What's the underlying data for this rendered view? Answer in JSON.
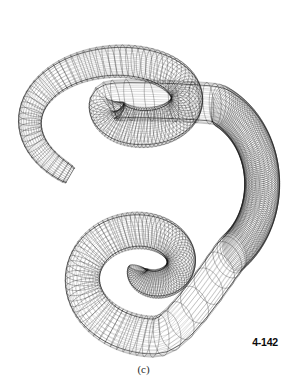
{
  "figure": {
    "number_label": "4-142",
    "caption": "(c)",
    "background_color": "#ffffff",
    "line_color": "#141414"
  },
  "chart_data": {
    "type": "line",
    "xlabel": "",
    "ylabel": "",
    "grid": false,
    "legend_position": "none",
    "xlim": [
      0,
      287
    ],
    "ylim": [
      0,
      386
    ],
    "render": {
      "stroke": "#141414",
      "stroke_width": 0.32,
      "ring_count": 300,
      "ring_segments": 26,
      "tube_radius_px": 17.5,
      "draw_longitudinals": true,
      "longitudinal_count": 26
    },
    "annotations": [
      {
        "text": "4-142",
        "x": 262,
        "y": 342,
        "bold": true
      },
      {
        "text": "(c)",
        "x": 143,
        "y": 370,
        "bold": false
      }
    ],
    "series": [
      {
        "name": "upper-spiral",
        "comment": "outer-to-inner clockwise spiral occupying the top of the frame",
        "spiral": {
          "cx": 128,
          "cy": 104,
          "rx_start": 112,
          "ry_start": 70,
          "rx_end": 18,
          "ry_end": 11,
          "theta_start": 2.05,
          "theta_sweep": 7.4,
          "z_start": 30,
          "z_end": -14,
          "tilt": 0.42
        }
      },
      {
        "name": "connector",
        "comment": "descending right-hand arc linking the two spirals",
        "spiral": {
          "cx": 196,
          "cy": 190,
          "rx_start": 74,
          "ry_start": 86,
          "rx_end": 60,
          "ry_end": 72,
          "theta_start": -1.35,
          "theta_sweep": 2.35,
          "z_start": -14,
          "z_end": 18,
          "tilt": 0.3
        }
      },
      {
        "name": "lower-spiral",
        "comment": "outer-to-inner spiral occupying the bottom of the frame, ending in a small hole",
        "spiral": {
          "cx": 146,
          "cy": 268,
          "rx_start": 82,
          "ry_start": 66,
          "rx_end": 9,
          "ry_end": 7,
          "theta_start": 1.15,
          "theta_sweep": 7.9,
          "z_start": 18,
          "z_end": -10,
          "tilt": 0.36
        }
      }
    ],
    "key_points": [
      {
        "name": "upper-spiral-center",
        "x": 112,
        "y": 98
      },
      {
        "name": "lower-spiral-center",
        "x": 157,
        "y": 292
      },
      {
        "name": "crossing-band-center",
        "x": 186,
        "y": 212
      },
      {
        "name": "bounds-left",
        "x": 14,
        "y": 186
      },
      {
        "name": "bounds-right",
        "x": 270,
        "y": 150
      },
      {
        "name": "bounds-top",
        "x": 150,
        "y": 18
      },
      {
        "name": "bounds-bottom",
        "x": 150,
        "y": 350
      }
    ]
  }
}
